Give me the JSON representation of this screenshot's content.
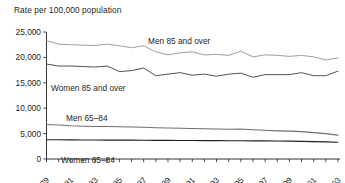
{
  "chart_title": "Rate per 100,000 population",
  "axis": {
    "y_label": "Rate per 100,000 population",
    "y_ticks": [
      "0",
      "5,000",
      "10,000",
      "15,000",
      "20,000",
      "25,000"
    ],
    "x_ticks": [
      "1979",
      "1981",
      "1983",
      "1985",
      "1987",
      "1989",
      "1991",
      "1993",
      "1995",
      "1997",
      "1999",
      "2001",
      "2003"
    ]
  },
  "labels": {
    "men85": "Men 85 and over",
    "women85": "Women 85 and over",
    "men6584": "Men 65–84",
    "women6584": "Women 65–84"
  },
  "colors": {
    "men85": "#9a9a9a",
    "women85": "#4a4a4a",
    "men6584": "#6f6f6f",
    "women6584": "#231f20",
    "axis": "#231f20"
  },
  "chart_data": {
    "type": "line",
    "title": "Rate per 100,000 population",
    "xlabel": "",
    "ylabel": "Rate per 100,000 population",
    "ylim": [
      0,
      25000
    ],
    "yticks": [
      0,
      5000,
      10000,
      15000,
      20000,
      25000
    ],
    "grid": false,
    "legend_position": "inline-annotations",
    "x": [
      1979,
      1980,
      1981,
      1982,
      1983,
      1984,
      1985,
      1986,
      1987,
      1988,
      1989,
      1990,
      1991,
      1992,
      1993,
      1994,
      1995,
      1996,
      1997,
      1998,
      1999,
      2000,
      2001,
      2002,
      2003
    ],
    "series": [
      {
        "name": "Men 85 and over",
        "color": "#9a9a9a",
        "values": [
          23300,
          22600,
          22500,
          22400,
          22350,
          22600,
          22300,
          21900,
          22300,
          21100,
          20500,
          20900,
          21100,
          20500,
          20600,
          20400,
          21200,
          20100,
          20500,
          20400,
          20200,
          20400,
          20100,
          19500,
          19900
        ]
      },
      {
        "name": "Women 85 and over",
        "color": "#4a4a4a",
        "values": [
          18700,
          18300,
          18300,
          18200,
          18100,
          18300,
          17200,
          17400,
          17900,
          16400,
          16700,
          17000,
          16500,
          16700,
          16300,
          16700,
          16900,
          16100,
          16600,
          16600,
          16600,
          17000,
          16400,
          16400,
          17300
        ]
      },
      {
        "name": "Men 65–84",
        "color": "#6f6f6f",
        "values": [
          6800,
          6700,
          6550,
          6450,
          6400,
          6400,
          6350,
          6300,
          6250,
          6150,
          6100,
          6050,
          6000,
          5950,
          5900,
          5850,
          5900,
          5750,
          5650,
          5550,
          5500,
          5400,
          5200,
          5000,
          4700
        ]
      },
      {
        "name": "Women 65–84",
        "color": "#231f20",
        "values": [
          3800,
          3780,
          3760,
          3750,
          3740,
          3730,
          3720,
          3710,
          3700,
          3680,
          3660,
          3650,
          3640,
          3630,
          3620,
          3600,
          3600,
          3580,
          3560,
          3540,
          3520,
          3480,
          3420,
          3360,
          3300
        ]
      }
    ]
  }
}
